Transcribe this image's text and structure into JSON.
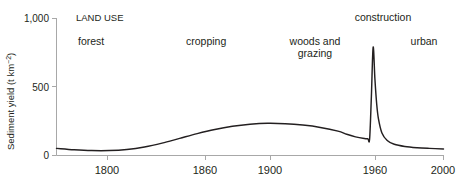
{
  "figure": {
    "background_color": "#ffffff",
    "curve_color": "#231f20",
    "axis_color": "#a8a8a8"
  },
  "axes": {
    "y_label_main": "Sediment yield (t km",
    "y_label_sup": "−2",
    "y_label_close": ")",
    "y_ticks": [
      "1,000",
      "500",
      "0"
    ],
    "x_ticks": [
      "1800",
      "1860",
      "1900",
      "1960",
      "2000"
    ]
  },
  "annotations": {
    "heading": "LAND USE",
    "phases": [
      {
        "label": "forest"
      },
      {
        "label": "cropping"
      },
      {
        "label_line1": "woods and",
        "label_line2": "grazing"
      },
      {
        "label": "construction"
      },
      {
        "label": "urban"
      }
    ]
  },
  "chart_data": {
    "type": "line",
    "title": "",
    "xlabel": "",
    "ylabel": "Sediment yield (t km−2)",
    "xlim": [
      1780,
      2000
    ],
    "ylim": [
      0,
      1000
    ],
    "xticks": [
      1800,
      1860,
      1900,
      1960,
      2000
    ],
    "yticks": [
      0,
      500,
      1000
    ],
    "grid": false,
    "legend": "none",
    "series": [
      {
        "name": "Sediment yield",
        "x": [
          1780,
          1790,
          1800,
          1810,
          1820,
          1830,
          1840,
          1850,
          1860,
          1870,
          1880,
          1890,
          1900,
          1910,
          1920,
          1930,
          1940,
          1945,
          1950,
          1955,
          1957,
          1958,
          1959,
          1960,
          1961,
          1962,
          1963,
          1965,
          1968,
          1972,
          1978,
          1985,
          1992,
          2000
        ],
        "y": [
          52,
          42,
          36,
          36,
          44,
          62,
          90,
          125,
          160,
          190,
          213,
          228,
          235,
          232,
          222,
          205,
          178,
          155,
          136,
          124,
          122,
          121,
          430,
          790,
          560,
          380,
          270,
          165,
          110,
          82,
          66,
          57,
          52,
          48
        ]
      }
    ],
    "annotations": [
      {
        "text": "LAND USE",
        "x": 1790,
        "y": 980
      },
      {
        "text": "forest",
        "x": 1793,
        "y": 870
      },
      {
        "text": "cropping",
        "x": 1845,
        "y": 870
      },
      {
        "text": "woods and grazing",
        "x": 1910,
        "y": 860
      },
      {
        "text": "construction",
        "x": 1952,
        "y": 975
      },
      {
        "text": "urban",
        "x": 1985,
        "y": 880
      }
    ]
  }
}
